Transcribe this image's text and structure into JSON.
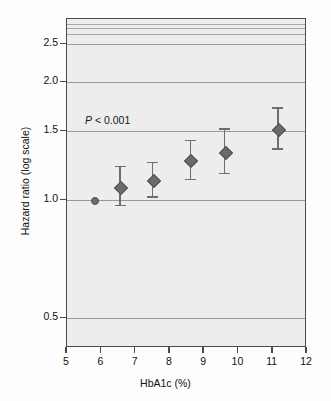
{
  "figure": {
    "background_color": "#fdfdfd",
    "plot_background_color": "#ededed",
    "marker_color": "#6b6b6b",
    "gridline_color": "#a7a7a7",
    "axis_color": "#4a4a4a"
  },
  "annotation": {
    "p_symbol": "P",
    "p_text": " < 0.001"
  },
  "chart_data": {
    "type": "scatter",
    "title": "",
    "subtitle": "",
    "xlabel": "HbA1c (%)",
    "ylabel": "Hazard ratio (log scale)",
    "yscale": "log",
    "xlim": [
      5,
      12
    ],
    "ylim": [
      0.42,
      2.9
    ],
    "grid": true,
    "legend": "none",
    "xticks": [
      5,
      6,
      7,
      8,
      9,
      10,
      11,
      12
    ],
    "xtick_labels": [
      "5",
      "6",
      "7",
      "8",
      "9",
      "10",
      "11",
      "12"
    ],
    "yticks": [
      0.5,
      1.0,
      1.5,
      2.0,
      2.5
    ],
    "ytick_labels": [
      "0.5",
      "1.0",
      "1.5",
      "2.0",
      "2.5"
    ],
    "gridline_values": [
      0.5,
      1.0,
      1.5,
      2.0,
      2.5,
      2.65,
      2.75,
      2.82
    ],
    "annotations": [
      "P < 0.001"
    ],
    "series": [
      {
        "name": "Hazard ratio by HbA1c category",
        "x": [
          5.8,
          6.55,
          7.5,
          8.6,
          9.6,
          11.15
        ],
        "values": [
          1.0,
          1.08,
          1.13,
          1.27,
          1.33,
          1.52
        ],
        "ci_low": [
          null,
          0.97,
          1.02,
          1.13,
          1.17,
          1.35
        ],
        "ci_high": [
          null,
          1.22,
          1.25,
          1.42,
          1.52,
          1.72
        ],
        "reference_index": 0
      }
    ]
  }
}
